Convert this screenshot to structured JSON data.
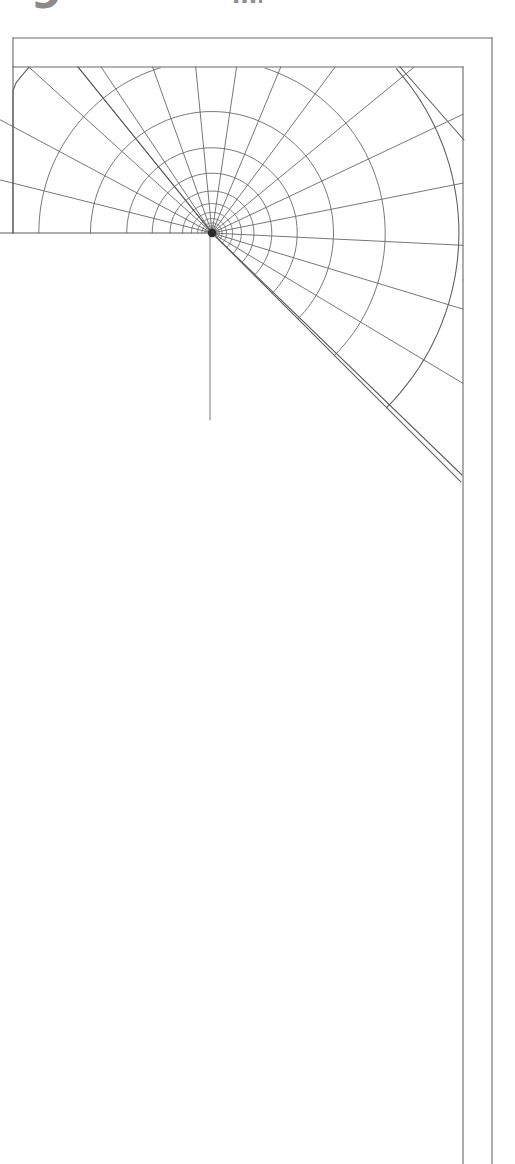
{
  "document": {
    "kind": "scanned-technical-figure",
    "page_background": "#ffffff",
    "ink_color": "#5c5c5c",
    "dark_ink_color": "#3d3d3d",
    "width_px": 515,
    "height_px": 1164
  },
  "top_text_fragments": [
    {
      "name": "glyph-fragment-left",
      "text": "9",
      "note": "bottom sliver of a bold character, clipped by page crop",
      "color": "#8a8a8a",
      "x": 31,
      "y": 0,
      "width": 34,
      "height": 15
    },
    {
      "name": "glyph-fragment-right",
      "text": "mm",
      "note": "small gray smudge, bottom sliver of clipped text",
      "color": "#8f8f8f",
      "x": 232,
      "y": 0,
      "width": 30,
      "height": 14
    }
  ],
  "figure": {
    "frame": {
      "name": "specimen-outline",
      "left": 13,
      "top": 38,
      "right": 492,
      "bottom": 1164,
      "inner_vertical_x": 463,
      "top_band_bottom_y": 67
    },
    "crack_tip": {
      "name": "crack-tip-node",
      "x": 212,
      "y": 233,
      "blob_radius": 4.2
    },
    "crack_face": {
      "name": "crack-face-line",
      "x": 210,
      "y_start": 235,
      "y_end": 420
    },
    "mesh": {
      "type": "graded-polar-fan",
      "angle_start_deg": 180,
      "angle_end_deg": 45,
      "ray_count": 17,
      "ring_count": 14,
      "grading": "geometric, refining toward tip",
      "outer_radius_px": 352,
      "innermost_radius_px": 3.5
    },
    "corner_triangle": {
      "name": "corner-triangle-element",
      "points": [
        [
          400,
          67
        ],
        [
          464,
          67
        ],
        [
          464,
          140
        ]
      ]
    }
  }
}
